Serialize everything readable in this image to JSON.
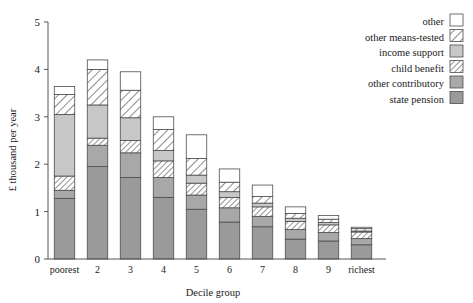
{
  "chart_data": {
    "type": "bar",
    "subtype": "stacked-bar",
    "title": "",
    "xlabel": "Decile group",
    "ylabel": "£ thousand per year",
    "categories": [
      "poorest",
      "2",
      "3",
      "4",
      "5",
      "6",
      "7",
      "8",
      "9",
      "richest"
    ],
    "ylim": [
      0,
      5
    ],
    "yticks": [
      0,
      1,
      2,
      3,
      4,
      5
    ],
    "ytick_labels": [
      "0",
      "1",
      "2",
      "3",
      "4",
      "5"
    ],
    "grid": false,
    "legend_position": "top-right",
    "stack_order_bottom_to_top": [
      "state pension",
      "other contributory",
      "child benefit",
      "income support",
      "other means-tested",
      "other"
    ],
    "series": [
      {
        "name": "state pension",
        "swatch": "solid-dark-gray",
        "color": "#9a9a9a",
        "values": [
          1.28,
          1.95,
          1.72,
          1.3,
          1.05,
          0.78,
          0.68,
          0.42,
          0.38,
          0.3
        ]
      },
      {
        "name": "other contributory",
        "swatch": "solid-medium-gray",
        "color": "#a8a8a8",
        "values": [
          0.17,
          0.45,
          0.52,
          0.42,
          0.3,
          0.3,
          0.22,
          0.2,
          0.18,
          0.13
        ]
      },
      {
        "name": "child benefit",
        "swatch": "hatched-dense",
        "color": "#ffffff",
        "values": [
          0.3,
          0.15,
          0.26,
          0.35,
          0.25,
          0.22,
          0.2,
          0.17,
          0.16,
          0.14
        ]
      },
      {
        "name": "income support",
        "swatch": "solid-light-gray",
        "color": "#c7c7c7",
        "values": [
          1.3,
          0.7,
          0.48,
          0.22,
          0.17,
          0.12,
          0.08,
          0.07,
          0.05,
          0.02
        ]
      },
      {
        "name": "other means-tested",
        "swatch": "hatched-sparse",
        "color": "#ffffff",
        "values": [
          0.42,
          0.75,
          0.58,
          0.44,
          0.35,
          0.2,
          0.14,
          0.1,
          0.07,
          0.05
        ]
      },
      {
        "name": "other",
        "swatch": "white",
        "color": "#ffffff",
        "values": [
          0.17,
          0.2,
          0.39,
          0.27,
          0.5,
          0.28,
          0.24,
          0.14,
          0.08,
          0.03
        ]
      }
    ],
    "totals": [
      3.64,
      4.2,
      3.95,
      3.0,
      2.62,
      1.9,
      1.56,
      1.1,
      0.92,
      0.67
    ]
  },
  "legend": {
    "items": [
      {
        "label": "other",
        "swatch": "white"
      },
      {
        "label": "other means-tested",
        "swatch": "hatched-sparse"
      },
      {
        "label": "income support",
        "swatch": "solid-light-gray"
      },
      {
        "label": "child benefit",
        "swatch": "hatched-dense"
      },
      {
        "label": "other contributory",
        "swatch": "solid-medium-gray"
      },
      {
        "label": "state pension",
        "swatch": "solid-dark-gray"
      }
    ]
  },
  "axes": {
    "y_title": "£ thousand per year",
    "x_title": "Decile group"
  },
  "colors": {
    "outline": "#4d4d4d",
    "axis": "#555555",
    "white": "#ffffff",
    "light_gray": "#c7c7c7",
    "medium_gray": "#a8a8a8",
    "dark_gray": "#9a9a9a",
    "text": "#1a1a1a"
  }
}
